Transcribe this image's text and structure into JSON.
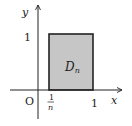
{
  "diagram": {
    "axes": {
      "x_label": "x",
      "y_label": "y",
      "origin_label": "O"
    },
    "ticks": {
      "y_one": "1",
      "x_one": "1",
      "x_frac_num": "1",
      "x_frac_den": "n"
    },
    "region": {
      "label_main": "D",
      "label_sub": "n",
      "fill_color": "#c6c6c6",
      "border_color": "#222222"
    }
  }
}
